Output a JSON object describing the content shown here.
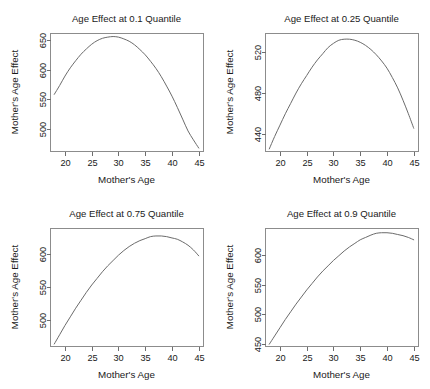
{
  "figure": {
    "width": 430,
    "height": 389,
    "background": "#ffffff",
    "line_color": "#6b6b6b",
    "frame_color": "#8c8c8c",
    "text_color": "#1a1a1a",
    "layout": "2x2 grid of quantile regression age-effect panels"
  },
  "chart_data": [
    {
      "type": "line",
      "id": "panel-q010",
      "title": "Age Effect at 0.1 Quantile",
      "xlabel": "Mother's Age",
      "ylabel": "Mother's Age Effect",
      "xlim": [
        17.2,
        45.8
      ],
      "ylim": [
        462,
        662
      ],
      "xticks": [
        20,
        25,
        30,
        35,
        40,
        45
      ],
      "yticks": [
        500,
        550,
        600,
        650
      ],
      "grid": false,
      "legend": null,
      "x": [
        18,
        19,
        20,
        21,
        22,
        23,
        24,
        25,
        26,
        27,
        28,
        29,
        30,
        31,
        32,
        33,
        34,
        35,
        36,
        37,
        38,
        39,
        40,
        41,
        42,
        43,
        44,
        45
      ],
      "y": [
        558,
        573,
        589,
        603,
        615,
        626,
        635,
        643,
        649,
        653,
        655,
        656,
        655,
        652,
        648,
        642,
        634,
        625,
        614,
        602,
        588,
        572,
        555,
        536,
        516,
        496,
        481,
        467
      ]
    },
    {
      "type": "line",
      "id": "panel-q025",
      "title": "Age Effect at 0.25 Quantile",
      "xlabel": "Mother's Age",
      "ylabel": "Mother's Age Effect",
      "xlim": [
        17.2,
        45.8
      ],
      "ylim": [
        424,
        538
      ],
      "xticks": [
        20,
        25,
        30,
        35,
        40,
        45
      ],
      "yticks": [
        440,
        480,
        520
      ],
      "grid": false,
      "legend": null,
      "x": [
        18,
        19,
        20,
        21,
        22,
        23,
        24,
        25,
        26,
        27,
        28,
        29,
        30,
        31,
        32,
        33,
        34,
        35,
        36,
        37,
        38,
        39,
        40,
        41,
        42,
        43,
        44,
        45
      ],
      "y": [
        426,
        438,
        449,
        460,
        470,
        480,
        489,
        497,
        505,
        512,
        518,
        524,
        528,
        531,
        532,
        532,
        531,
        529,
        526,
        522,
        517,
        511,
        504,
        495,
        485,
        473,
        460,
        446
      ]
    },
    {
      "type": "line",
      "id": "panel-q075",
      "title": "Age Effect at 0.75 Quantile",
      "xlabel": "Mother's Age",
      "ylabel": "Mother's Age Effect",
      "xlim": [
        17.2,
        45.8
      ],
      "ylim": [
        461,
        639
      ],
      "xticks": [
        20,
        25,
        30,
        35,
        40,
        45
      ],
      "yticks": [
        500,
        550,
        600
      ],
      "grid": false,
      "legend": null,
      "x": [
        18,
        19,
        20,
        21,
        22,
        23,
        24,
        25,
        26,
        27,
        28,
        29,
        30,
        31,
        32,
        33,
        34,
        35,
        36,
        37,
        38,
        39,
        40,
        41,
        42,
        43,
        44,
        45
      ],
      "y": [
        464,
        478,
        492,
        505,
        518,
        530,
        542,
        553,
        563,
        573,
        582,
        590,
        598,
        605,
        611,
        616,
        620,
        623,
        626,
        627,
        627,
        626,
        624,
        622,
        618,
        613,
        606,
        597
      ]
    },
    {
      "type": "line",
      "id": "panel-q090",
      "title": "Age Effect at 0.9 Quantile",
      "xlabel": "Mother's Age",
      "ylabel": "Mother's Age Effect",
      "xlim": [
        17.2,
        45.8
      ],
      "ylim": [
        446,
        646
      ],
      "xticks": [
        20,
        25,
        30,
        35,
        40,
        45
      ],
      "yticks": [
        450,
        500,
        550,
        600
      ],
      "grid": false,
      "legend": null,
      "x": [
        18,
        19,
        20,
        21,
        22,
        23,
        24,
        25,
        26,
        27,
        28,
        29,
        30,
        31,
        32,
        33,
        34,
        35,
        36,
        37,
        38,
        39,
        40,
        41,
        42,
        43,
        44,
        45
      ],
      "y": [
        449,
        463,
        477,
        491,
        504,
        517,
        529,
        541,
        552,
        563,
        573,
        582,
        591,
        599,
        607,
        614,
        620,
        626,
        630,
        634,
        637,
        638,
        638,
        637,
        635,
        633,
        630,
        626
      ]
    }
  ]
}
